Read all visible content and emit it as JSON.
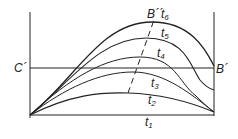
{
  "diagram": {
    "labels": {
      "c_prime": "C´",
      "b_prime": "B´",
      "b_double_prime": "B´´",
      "t1": "t",
      "t1_sub": "1",
      "t2": "t",
      "t2_sub": "2",
      "t3": "t",
      "t3_sub": "3",
      "t4": "t",
      "t4_sub": "4",
      "t5": "t",
      "t5_sub": "5",
      "t6": "t",
      "t6_sub": "6"
    },
    "curves": [
      {
        "name": "t1",
        "peak": "baseline"
      },
      {
        "name": "t2",
        "peak_y_rel": 0.2
      },
      {
        "name": "t3",
        "peak_y_rel": 0.41
      },
      {
        "name": "t4",
        "peak_y_rel": 0.56
      },
      {
        "name": "t5",
        "peak_y_rel": 0.74
      },
      {
        "name": "t6",
        "peak_y_rel": 0.89
      }
    ],
    "colors": {
      "stroke": "#222222",
      "background": "#ffffff"
    }
  }
}
